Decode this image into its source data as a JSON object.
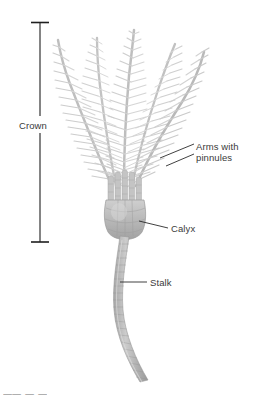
{
  "figure": {
    "background_color": "#ffffff",
    "organism_color_light": "#d7d7d7",
    "organism_color_mid": "#b4b4b4",
    "organism_color_dark": "#8f8f8f",
    "leader_line_color": "#2b2b2b",
    "label_text_color": "#3a3a3a"
  },
  "labels": {
    "crown": "Crown",
    "arms_line1": "Arms with",
    "arms_line2": "pinnules",
    "calyx": "Calyx",
    "stalk": "Stalk"
  },
  "bracket": {
    "name": "crown-measure-bracket",
    "orientation": "vertical",
    "top_y": 22,
    "bottom_y": 242,
    "x": 40
  },
  "parts": [
    {
      "id": "arms",
      "name": "Arms with pinnules",
      "description": "feathery branching arms bearing fine pinnules"
    },
    {
      "id": "calyx",
      "name": "Calyx",
      "description": "cup-shaped body at base of crown"
    },
    {
      "id": "stalk",
      "name": "Stalk",
      "description": "segmented column of ossicles"
    },
    {
      "id": "crown",
      "name": "Crown",
      "description": "arms plus calyx measured region"
    }
  ],
  "footer": {
    "cropped_caption": "ㅡㅡ  ㅡ  ㅡ"
  }
}
